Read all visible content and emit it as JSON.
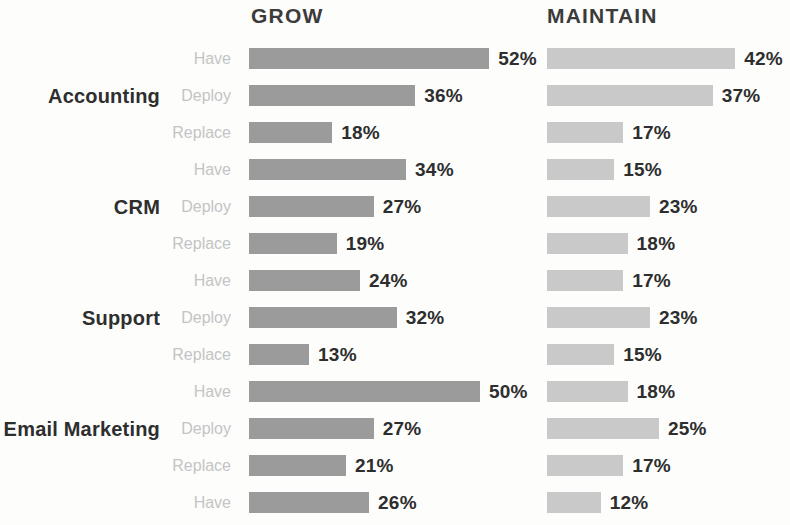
{
  "columns": [
    {
      "key": "grow",
      "label": "GROW",
      "color": "#9b9b9b"
    },
    {
      "key": "maintain",
      "label": "MAINTAIN",
      "color": "#c9c9c9"
    }
  ],
  "series_labels": [
    "Have",
    "Deploy",
    "Replace"
  ],
  "value_suffix": "%",
  "chart_data": {
    "type": "bar",
    "title": "",
    "subtitle": "",
    "xlabel": "",
    "ylabel": "",
    "orientation": "horizontal",
    "grid": false,
    "legend": "none",
    "xlim": [
      0,
      55
    ],
    "axis_visible": false,
    "value_format": "{v}%",
    "group_labels": [
      "Accounting",
      "CRM",
      "Support",
      "Email Marketing"
    ],
    "categories": [
      "Have",
      "Deploy",
      "Replace"
    ],
    "series": [
      {
        "name": "GROW",
        "color": "#9b9b9b"
      },
      {
        "name": "MAINTAIN",
        "color": "#c9c9c9"
      }
    ],
    "groups": [
      {
        "label": "Accounting",
        "rows": [
          {
            "label": "Have",
            "grow": 52,
            "maintain": 42
          },
          {
            "label": "Deploy",
            "grow": 36,
            "maintain": 37
          },
          {
            "label": "Replace",
            "grow": 18,
            "maintain": 17
          }
        ]
      },
      {
        "label": "CRM",
        "rows": [
          {
            "label": "Have",
            "grow": 34,
            "maintain": 15
          },
          {
            "label": "Deploy",
            "grow": 27,
            "maintain": 23
          },
          {
            "label": "Replace",
            "grow": 19,
            "maintain": 18
          }
        ]
      },
      {
        "label": "Support",
        "rows": [
          {
            "label": "Have",
            "grow": 24,
            "maintain": 17
          },
          {
            "label": "Deploy",
            "grow": 32,
            "maintain": 23
          },
          {
            "label": "Replace",
            "grow": 13,
            "maintain": 15
          }
        ]
      },
      {
        "label": "Email Marketing",
        "rows": [
          {
            "label": "Have",
            "grow": 50,
            "maintain": 18
          },
          {
            "label": "Deploy",
            "grow": 27,
            "maintain": 25
          },
          {
            "label": "Replace",
            "grow": 21,
            "maintain": 17
          }
        ]
      },
      {
        "label": "",
        "truncated": true,
        "rows": [
          {
            "label": "Have",
            "grow": 26,
            "maintain": 12
          }
        ]
      }
    ]
  },
  "render": {
    "px_per_percent_grow": 4.62,
    "px_per_percent_maintain": 4.48,
    "row_height_px": 37
  }
}
